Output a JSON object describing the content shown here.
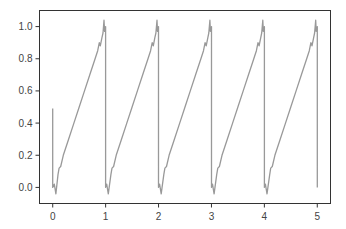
{
  "chart_data": {
    "type": "line",
    "title": "",
    "xlabel": "",
    "ylabel": "",
    "xlim": [
      -0.25,
      5.25
    ],
    "ylim": [
      -0.1,
      1.1
    ],
    "grid": false,
    "legend": null,
    "x_ticks": [
      "0",
      "1",
      "2",
      "3",
      "4",
      "5"
    ],
    "y_ticks": [
      "0.0",
      "0.2",
      "0.4",
      "0.6",
      "0.8",
      "1.0"
    ],
    "series": [
      {
        "name": "sawtooth",
        "color": "#999999",
        "x": [
          0,
          0,
          0.03,
          0.06,
          0.1,
          0.12,
          0.15,
          0.2,
          0.3,
          0.4,
          0.5,
          0.6,
          0.7,
          0.8,
          0.85,
          0.88,
          0.9,
          0.93,
          0.95,
          0.97,
          0.98,
          1.0,
          1.0,
          1.02,
          1.05,
          1.1,
          1.12,
          1.15,
          1.2,
          1.3,
          1.4,
          1.5,
          1.6,
          1.7,
          1.8,
          1.85,
          1.88,
          1.9,
          1.93,
          1.95,
          1.97,
          1.98,
          2.0,
          2.0,
          2.02,
          2.05,
          2.1,
          2.12,
          2.15,
          2.2,
          2.3,
          2.4,
          2.5,
          2.6,
          2.7,
          2.8,
          2.85,
          2.88,
          2.9,
          2.93,
          2.95,
          2.97,
          2.98,
          3.0,
          3.0,
          3.02,
          3.05,
          3.1,
          3.12,
          3.15,
          3.2,
          3.3,
          3.4,
          3.5,
          3.6,
          3.7,
          3.8,
          3.85,
          3.88,
          3.9,
          3.93,
          3.95,
          3.97,
          3.98,
          4.0,
          4.0,
          4.02,
          4.05,
          4.1,
          4.12,
          4.15,
          4.2,
          4.3,
          4.4,
          4.5,
          4.6,
          4.7,
          4.8,
          4.85,
          4.88,
          4.9,
          4.93,
          4.95,
          4.97,
          4.98,
          5.0,
          5.0
        ],
        "y": [
          0.49,
          0.0,
          0.02,
          -0.04,
          0.08,
          0.12,
          0.13,
          0.2,
          0.3,
          0.4,
          0.5,
          0.6,
          0.7,
          0.8,
          0.85,
          0.9,
          0.88,
          0.93,
          0.96,
          1.04,
          0.97,
          1.0,
          0.0,
          0.02,
          -0.04,
          0.08,
          0.12,
          0.13,
          0.2,
          0.3,
          0.4,
          0.5,
          0.6,
          0.7,
          0.8,
          0.85,
          0.9,
          0.88,
          0.93,
          0.96,
          1.04,
          0.97,
          1.0,
          0.0,
          0.02,
          -0.04,
          0.08,
          0.12,
          0.13,
          0.2,
          0.3,
          0.4,
          0.5,
          0.6,
          0.7,
          0.8,
          0.85,
          0.9,
          0.88,
          0.93,
          0.96,
          1.04,
          0.97,
          1.0,
          0.0,
          0.02,
          -0.04,
          0.08,
          0.12,
          0.13,
          0.2,
          0.3,
          0.4,
          0.5,
          0.6,
          0.7,
          0.8,
          0.85,
          0.9,
          0.88,
          0.93,
          0.96,
          1.04,
          0.97,
          1.0,
          0.0,
          0.02,
          -0.04,
          0.08,
          0.12,
          0.13,
          0.2,
          0.3,
          0.4,
          0.5,
          0.6,
          0.7,
          0.8,
          0.85,
          0.9,
          0.88,
          0.93,
          0.96,
          1.04,
          0.97,
          1.0,
          0.0
        ]
      }
    ]
  },
  "style": {
    "frame_color": "#333333",
    "line_color": "#999999",
    "tick_label_color": "#444444"
  }
}
